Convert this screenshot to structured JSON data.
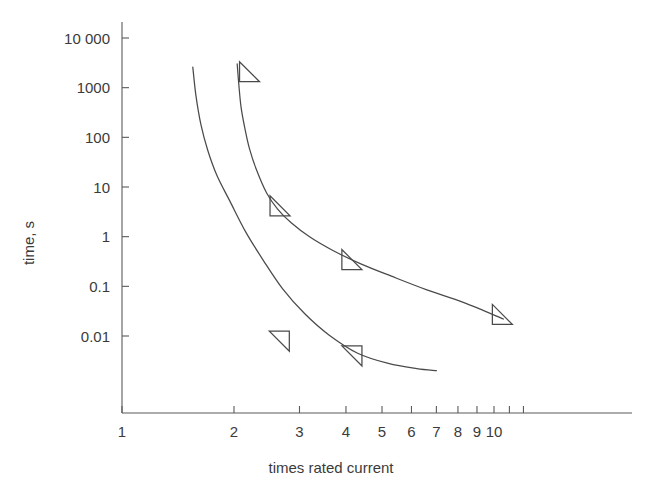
{
  "chart_data": {
    "type": "line",
    "title": "",
    "xlabel": "times rated current",
    "ylabel": "time, s",
    "xscale": "log",
    "yscale": "log",
    "xlim": [
      1,
      11.5
    ],
    "ylim": [
      0.0025,
      30000
    ],
    "grid": false,
    "legend": null,
    "x_tick_labels": [
      "1",
      "2",
      "3",
      "4",
      "5",
      "6",
      "7",
      "8",
      "9",
      "10"
    ],
    "x_tick_values": [
      1,
      2,
      3,
      4,
      5,
      6,
      7,
      8,
      9,
      10
    ],
    "y_tick_labels": [
      "10 000",
      "1000",
      "100",
      "10",
      "1",
      "0.1",
      "0.01"
    ],
    "y_tick_values": [
      10000,
      1000,
      100,
      10,
      1,
      0.1,
      0.01
    ],
    "series": [
      {
        "name": "upper-curve",
        "marker": "triangle-right",
        "marker_points": [
          {
            "x": 2.07,
            "y": 2000
          },
          {
            "x": 2.5,
            "y": 4.0
          },
          {
            "x": 3.9,
            "y": 0.33
          },
          {
            "x": 9.9,
            "y": 0.026
          }
        ],
        "x": [
          2.04,
          2.06,
          2.09,
          2.14,
          2.2,
          2.3,
          2.45,
          2.62,
          2.85,
          3.2,
          3.7,
          4.4,
          5.3,
          6.6,
          8.3,
          10.6
        ],
        "y": [
          3000,
          1200,
          400,
          150,
          60,
          22,
          7.5,
          3.6,
          1.9,
          0.98,
          0.52,
          0.28,
          0.16,
          0.085,
          0.047,
          0.022
        ]
      },
      {
        "name": "lower-curve",
        "marker": "triangle-left",
        "marker_points": [
          {
            "x": 2.52,
            "y": 0.0075
          },
          {
            "x": 3.95,
            "y": 0.0038
          }
        ],
        "x": [
          1.55,
          1.58,
          1.63,
          1.7,
          1.8,
          1.95,
          2.15,
          2.4,
          2.7,
          3.1,
          3.6,
          4.3,
          5.2,
          6.2,
          7.0
        ],
        "y": [
          2600,
          700,
          180,
          55,
          17,
          5.2,
          1.25,
          0.33,
          0.09,
          0.028,
          0.0105,
          0.0045,
          0.0028,
          0.0022,
          0.002
        ]
      }
    ]
  },
  "colors": {
    "axis": "#5a5a5a",
    "curve": "#4a4a4a",
    "text": "#3b3b3b",
    "background": "#ffffff"
  }
}
